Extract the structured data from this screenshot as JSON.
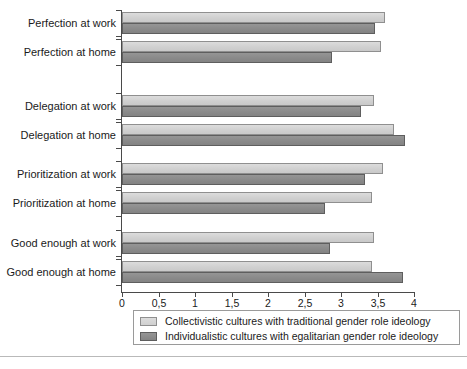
{
  "chart_data": {
    "type": "bar",
    "orientation": "horizontal",
    "title": "",
    "xlabel": "",
    "ylabel": "",
    "xlim": [
      0,
      4
    ],
    "grid": false,
    "legend_position": "bottom",
    "decimal_separator": ",",
    "categories": [
      "Perfection at work",
      "Perfection at home",
      "Delegation at work",
      "Delegation at home",
      "Prioritization at work",
      "Prioritization at home",
      "Good enough at work",
      "Good enough at home"
    ],
    "xtick_labels": [
      "0",
      "0,5",
      "1",
      "1,5",
      "2",
      "2,5",
      "3",
      "3,5",
      "4"
    ],
    "xtick_values": [
      0,
      0.5,
      1,
      1.5,
      2,
      2.5,
      3,
      3.5,
      4
    ],
    "series": [
      {
        "name": "Collectivistic cultures with traditional gender role ideology",
        "color": "#d4d4d4",
        "values": [
          3.6,
          3.55,
          3.45,
          3.72,
          3.58,
          3.42,
          3.45,
          3.42
        ]
      },
      {
        "name": "Individualistic cultures with egalitarian gender role ideology",
        "color": "#8c8c8c",
        "values": [
          3.47,
          2.87,
          3.28,
          3.88,
          3.33,
          2.78,
          2.85,
          3.85
        ]
      }
    ]
  },
  "legend": {
    "entries": [
      {
        "swatch": "light-gray-swatch",
        "label": "Collectivistic cultures with traditional gender role ideology"
      },
      {
        "swatch": "dark-gray-swatch",
        "label": "Individualistic cultures with egalitarian gender role ideology"
      }
    ]
  }
}
